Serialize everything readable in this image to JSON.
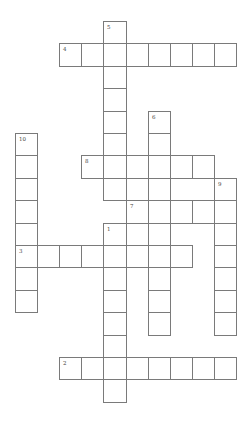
{
  "puzzle": {
    "type": "crossword",
    "layout": {
      "origin_x": 15,
      "origin_y": 21,
      "cell_w": 22.1,
      "cell_h": 22.4,
      "line_color": "#7a7a7a",
      "background": "#ffffff"
    },
    "words": [
      {
        "number": "1",
        "direction": "down",
        "col": 4,
        "row": 9,
        "length": 8
      },
      {
        "number": "2",
        "direction": "across",
        "col": 2,
        "row": 15,
        "length": 8
      },
      {
        "number": "3",
        "direction": "across",
        "col": 0,
        "row": 10,
        "length": 8
      },
      {
        "number": "4",
        "direction": "across",
        "col": 2,
        "row": 1,
        "length": 8
      },
      {
        "number": "5",
        "direction": "down",
        "col": 4,
        "row": 0,
        "length": 8
      },
      {
        "number": "6",
        "direction": "down",
        "col": 6,
        "row": 4,
        "length": 10
      },
      {
        "number": "7",
        "direction": "across",
        "col": 5,
        "row": 8,
        "length": 5
      },
      {
        "number": "8",
        "direction": "across",
        "col": 3,
        "row": 6,
        "length": 6
      },
      {
        "number": "9",
        "direction": "down",
        "col": 9,
        "row": 7,
        "length": 7
      },
      {
        "number": "10",
        "direction": "down",
        "col": 0,
        "row": 5,
        "length": 8
      }
    ]
  }
}
